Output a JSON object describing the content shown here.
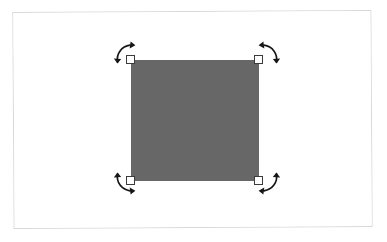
{
  "app": {
    "name": "graphics-canvas",
    "background_color": "#ffffff"
  },
  "canvas": {
    "frame_label": "artboard-frame",
    "frame_border_color": "#d8d8d8",
    "surface_color": "#ffffff",
    "x": 13,
    "y": 11,
    "width": 359,
    "height": 217,
    "rotation_deg": -0.35
  },
  "shape": {
    "type": "rectangle",
    "label": "selected-rectangle",
    "fill_color": "#676767",
    "x": 131,
    "y": 60,
    "width": 128,
    "height": 121,
    "selected": true
  },
  "selection": {
    "handle_fill": "#ffffff",
    "handle_border": "#3b3b3b",
    "handle_size": 9,
    "handles": [
      {
        "name": "handle-top-left",
        "position": "top-left"
      },
      {
        "name": "handle-top-right",
        "position": "top-right"
      },
      {
        "name": "handle-bottom-left",
        "position": "bottom-left"
      },
      {
        "name": "handle-bottom-right",
        "position": "bottom-right"
      }
    ],
    "rotation_arrows": [
      {
        "name": "rotate-arrow-top-left",
        "position": "top-left",
        "direction": "counter-clockwise"
      },
      {
        "name": "rotate-arrow-top-right",
        "position": "top-right",
        "direction": "clockwise"
      },
      {
        "name": "rotate-arrow-bottom-left",
        "position": "bottom-left",
        "direction": "clockwise"
      },
      {
        "name": "rotate-arrow-bottom-right",
        "position": "bottom-right",
        "direction": "counter-clockwise"
      }
    ],
    "arrow_color": "#161616"
  }
}
